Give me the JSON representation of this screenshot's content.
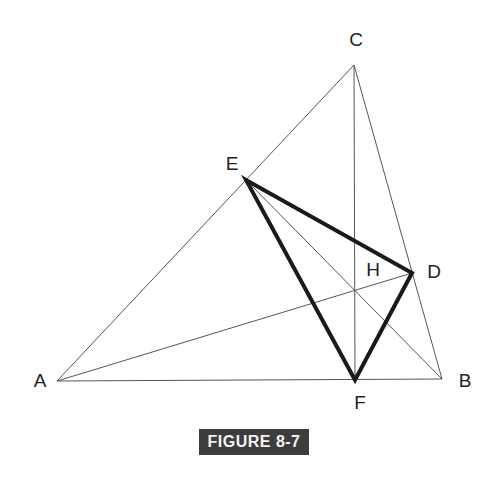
{
  "figure": {
    "caption": "FIGURE 8-7",
    "points": {
      "A": {
        "label": "A",
        "x": 57,
        "y": 381
      },
      "B": {
        "label": "B",
        "x": 442,
        "y": 379
      },
      "C": {
        "label": "C",
        "x": 354,
        "y": 65
      },
      "D": {
        "label": "D",
        "x": 412,
        "y": 273
      },
      "E": {
        "label": "E",
        "x": 246,
        "y": 180
      },
      "F": {
        "label": "F",
        "x": 355,
        "y": 380
      },
      "H": {
        "label": "H",
        "x": 355,
        "y": 290
      }
    },
    "thin_segments": [
      [
        "A",
        "B"
      ],
      [
        "B",
        "C"
      ],
      [
        "C",
        "A"
      ],
      [
        "C",
        "F"
      ],
      [
        "A",
        "D"
      ],
      [
        "E",
        "B"
      ]
    ],
    "thick_segments": [
      [
        "D",
        "E"
      ],
      [
        "E",
        "F"
      ],
      [
        "F",
        "D"
      ]
    ]
  }
}
